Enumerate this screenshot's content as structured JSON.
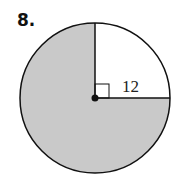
{
  "problem": {
    "number": "8.",
    "radius_label": "12"
  },
  "figure": {
    "shape": "circle",
    "unshaded_sector": "quarter (upper-right, 90°)",
    "shaded_fill": "#c9c9c9",
    "right_angle_marker": true
  }
}
